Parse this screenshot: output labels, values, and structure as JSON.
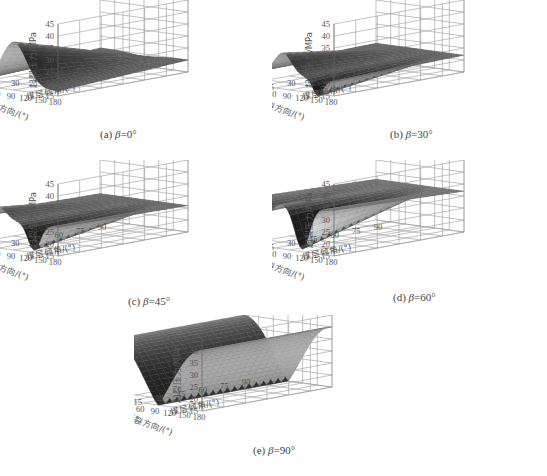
{
  "figure": {
    "panels": [
      {
        "id": "a",
        "label_prefix": "(a) ",
        "beta_symbol": "β",
        "label_suffix": "=0°"
      },
      {
        "id": "b",
        "label_prefix": "(b) ",
        "beta_symbol": "β",
        "label_suffix": "=30°"
      },
      {
        "id": "c",
        "label_prefix": "(c) ",
        "beta_symbol": "β",
        "label_suffix": "=45°"
      },
      {
        "id": "d",
        "label_prefix": "(d) ",
        "beta_symbol": "β",
        "label_suffix": "=60°"
      },
      {
        "id": "e",
        "label_prefix": "(e) ",
        "beta_symbol": "β",
        "label_suffix": "=90°"
      }
    ],
    "zlabel": "起裂压力/MPa",
    "ylabel": "起裂方向/(°)",
    "xlabel": "煤层倾角/(°)"
  },
  "chart_data": [
    {
      "type": "surface",
      "title": "(a) β=0°",
      "xlabel": "煤层倾角/(°)",
      "ylabel": "起裂方向/(°)",
      "zlabel": "起裂压力/MPa",
      "x_ticks": [
        0,
        15,
        30,
        45,
        60,
        75,
        90
      ],
      "y_ticks": [
        0,
        30,
        60,
        90,
        120,
        150,
        180
      ],
      "z_ticks": [
        15,
        20,
        25,
        30,
        35,
        40,
        45
      ],
      "xlim": [
        0,
        90
      ],
      "ylim": [
        0,
        180
      ],
      "zlim": [
        15,
        45
      ],
      "grid": true,
      "description": "Ridge along 起裂方向≈90° peaking ~34 MPa at 煤层倾角 0°, flattening to ~20 MPa at 90°; edges ~15-17 MPa"
    },
    {
      "type": "surface",
      "title": "(b) β=30°",
      "xlabel": "煤层倾角/(°)",
      "ylabel": "起裂方向/(°)",
      "zlabel": "起裂压力/MPa",
      "x_ticks": [
        0,
        15,
        30,
        45,
        60,
        75,
        90
      ],
      "y_ticks": [
        0,
        30,
        60,
        90,
        120,
        150,
        180
      ],
      "z_ticks": [
        15,
        20,
        25,
        30,
        35,
        40,
        45
      ],
      "xlim": [
        0,
        90
      ],
      "ylim": [
        0,
        180
      ],
      "zlim": [
        15,
        45
      ],
      "grid": true,
      "description": "Peak ~31 MPa near 起裂方向 60-90°, trough ~15 MPa near 150°, edges ~21 MPa; converges to ~22 MPa at 倾角 90°"
    },
    {
      "type": "surface",
      "title": "(c) β=45°",
      "xlabel": "煤层倾角/(°)",
      "ylabel": "起裂方向/(°)",
      "zlabel": "起裂压力/MPa",
      "x_ticks": [
        0,
        15,
        30,
        45,
        60,
        75,
        90
      ],
      "y_ticks": [
        0,
        30,
        60,
        90,
        120,
        150,
        180
      ],
      "z_ticks": [
        15,
        20,
        25,
        30,
        35,
        40,
        45
      ],
      "xlim": [
        0,
        90
      ],
      "ylim": [
        0,
        180
      ],
      "zlim": [
        15,
        45
      ],
      "grid": true,
      "description": "Peak ~31 MPa near 起裂方向 45-60°, trough ~15 MPa near 135°, edges ~27 MPa; converges to ~26 MPa at 倾角 90°"
    },
    {
      "type": "surface",
      "title": "(d) β=60°",
      "xlabel": "煤层倾角/(°)",
      "ylabel": "起裂方向/(°)",
      "zlabel": "起裂压力/MPa",
      "x_ticks": [
        0,
        15,
        30,
        45,
        60,
        75,
        90
      ],
      "y_ticks": [
        0,
        30,
        60,
        90,
        120,
        150,
        180
      ],
      "z_ticks": [
        15,
        20,
        25,
        30,
        35,
        40,
        45
      ],
      "xlim": [
        0,
        90
      ],
      "ylim": [
        0,
        180
      ],
      "zlim": [
        15,
        45
      ],
      "grid": true,
      "description": "Edges ~33-34 MPa, trough ~15 MPa near 起裂方向 120°, secondary rise ~30 MPa at 30°; converges to ~32 MPa at 倾角 90°"
    },
    {
      "type": "surface",
      "title": "(e) β=90°",
      "xlabel": "煤层倾角/(°)",
      "ylabel": "起裂方向/(°)",
      "zlabel": "起裂压力/MPa",
      "x_ticks": [
        0,
        15,
        30,
        45,
        60,
        75,
        90
      ],
      "y_ticks": [
        0,
        30,
        60,
        90,
        120,
        150,
        180
      ],
      "z_ticks": [
        15,
        20,
        25,
        30,
        35,
        40,
        45
      ],
      "xlim": [
        0,
        90
      ],
      "ylim": [
        0,
        180
      ],
      "zlim": [
        15,
        45
      ],
      "grid": true,
      "description": "Trough ~15 MPa at 起裂方向 90°, rising to ~40 MPa at 0° and 180°; nearly independent of 倾角"
    }
  ]
}
